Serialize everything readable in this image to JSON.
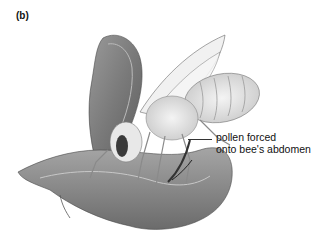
{
  "figure": {
    "panel_label": "(b)",
    "annotations": [
      {
        "line1": "pollen forced",
        "line2": "onto bee's abdomen"
      }
    ]
  }
}
